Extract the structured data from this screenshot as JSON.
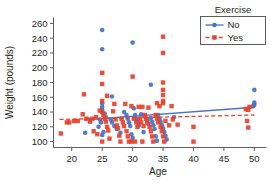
{
  "chart_data": {
    "type": "scatter",
    "title": "",
    "xlabel": "Age",
    "ylabel": "Weight (pounds)",
    "xlim": [
      17,
      52
    ],
    "ylim": [
      92,
      268
    ],
    "xticks": [
      20,
      25,
      30,
      35,
      40,
      45,
      50
    ],
    "yticks": [
      100,
      120,
      140,
      160,
      180,
      200,
      220,
      240,
      260
    ],
    "grid": false,
    "legend": {
      "title": "Exercise",
      "position": "top-right",
      "entries": [
        {
          "label": "No",
          "color": "#4472c4",
          "marker": "circle",
          "line": "solid"
        },
        {
          "label": "Yes",
          "color": "#e8402a",
          "marker": "square",
          "line": "dashed"
        }
      ]
    },
    "series": [
      {
        "name": "No",
        "color": "#4472c4",
        "marker": "circle",
        "fit_line": {
          "style": "solid",
          "x": [
            22,
            50
          ],
          "y": [
            129.5,
            146.5
          ]
        },
        "points": [
          [
            25,
            251
          ],
          [
            25,
            225
          ],
          [
            30,
            234
          ],
          [
            33,
            177
          ],
          [
            26.6,
            161
          ],
          [
            50,
            170
          ],
          [
            50,
            153
          ],
          [
            50,
            150
          ],
          [
            49.8,
            148
          ],
          [
            25,
            152
          ],
          [
            25,
            147
          ],
          [
            25,
            143
          ],
          [
            25.4,
            138
          ],
          [
            25.6,
            133
          ],
          [
            24.6,
            130
          ],
          [
            24.8,
            126
          ],
          [
            24.4,
            120
          ],
          [
            25.2,
            113
          ],
          [
            25,
            109
          ],
          [
            22.2,
            112
          ],
          [
            23,
            130
          ],
          [
            26.4,
            130
          ],
          [
            26.6,
            126
          ],
          [
            27,
            121
          ],
          [
            28.6,
            140
          ],
          [
            29,
            136
          ],
          [
            29.2,
            131
          ],
          [
            29.4,
            126
          ],
          [
            29.6,
            121
          ],
          [
            29.8,
            110
          ],
          [
            30.2,
            145
          ],
          [
            30.4,
            136
          ],
          [
            30.6,
            131
          ],
          [
            30.8,
            127
          ],
          [
            31,
            122
          ],
          [
            31.4,
            137
          ],
          [
            32,
            134
          ],
          [
            32.4,
            129
          ],
          [
            32.6,
            124
          ],
          [
            33,
            132
          ],
          [
            33.2,
            127
          ],
          [
            33.4,
            122
          ],
          [
            33.6,
            117
          ],
          [
            33.8,
            107
          ],
          [
            34.2,
            136
          ],
          [
            34.4,
            131
          ],
          [
            34.6,
            127
          ],
          [
            34.8,
            122
          ],
          [
            35,
            118
          ],
          [
            35.2,
            113
          ],
          [
            35.4,
            108
          ],
          [
            36.8,
            133
          ],
          [
            27.4,
            117
          ],
          [
            28,
            112
          ],
          [
            31.8,
            113
          ],
          [
            30,
            105
          ],
          [
            34,
            101
          ],
          [
            35.6,
            103
          ]
        ]
      },
      {
        "name": "Yes",
        "color": "#e8402a",
        "marker": "square",
        "fit_line": {
          "style": "dashed",
          "x": [
            18,
            50
          ],
          "y": [
            130,
            136
          ]
        },
        "points": [
          [
            35,
            242
          ],
          [
            35,
            220
          ],
          [
            30,
            188
          ],
          [
            25,
            193
          ],
          [
            25,
            178
          ],
          [
            35,
            180
          ],
          [
            35,
            170
          ],
          [
            35,
            163
          ],
          [
            35,
            155
          ],
          [
            35,
            152
          ],
          [
            36.4,
            148
          ],
          [
            22,
            164
          ],
          [
            25.8,
            162
          ],
          [
            25,
            155
          ],
          [
            27,
            151
          ],
          [
            28.8,
            151
          ],
          [
            29.8,
            148
          ],
          [
            31,
            147
          ],
          [
            31.6,
            147
          ],
          [
            32.6,
            146
          ],
          [
            34,
            152
          ],
          [
            34.4,
            148
          ],
          [
            18.2,
            111
          ],
          [
            19.2,
            126
          ],
          [
            19.6,
            126
          ],
          [
            20.4,
            128
          ],
          [
            21,
            128
          ],
          [
            21.8,
            137
          ],
          [
            22.4,
            131
          ],
          [
            23,
            127
          ],
          [
            23.4,
            131
          ],
          [
            24,
            133
          ],
          [
            24.6,
            142
          ],
          [
            25,
            140
          ],
          [
            25.2,
            136
          ],
          [
            25.4,
            131
          ],
          [
            25.6,
            127
          ],
          [
            25.8,
            120
          ],
          [
            26,
            115
          ],
          [
            25,
            100
          ],
          [
            26.8,
            141
          ],
          [
            27.2,
            130
          ],
          [
            27.4,
            122
          ],
          [
            27.6,
            118
          ],
          [
            27.8,
            108
          ],
          [
            28.2,
            131
          ],
          [
            28.4,
            126
          ],
          [
            28.6,
            121
          ],
          [
            29,
            114
          ],
          [
            29.2,
            107
          ],
          [
            29.4,
            100
          ],
          [
            29.8,
            100
          ],
          [
            30.2,
            131
          ],
          [
            30.6,
            126
          ],
          [
            30.8,
            120
          ],
          [
            31.2,
            131
          ],
          [
            31.4,
            126
          ],
          [
            31.8,
            121
          ],
          [
            32,
            136
          ],
          [
            32.2,
            131
          ],
          [
            32.4,
            126
          ],
          [
            32.8,
            120
          ],
          [
            33,
            114
          ],
          [
            33.2,
            107
          ],
          [
            33.4,
            100
          ],
          [
            33.8,
            136
          ],
          [
            34,
            131
          ],
          [
            34.2,
            126
          ],
          [
            34.6,
            120
          ],
          [
            34.8,
            114
          ],
          [
            35,
            107
          ],
          [
            35.2,
            100
          ],
          [
            35.4,
            128
          ],
          [
            36,
            122
          ],
          [
            36.6,
            130
          ],
          [
            37.4,
            123
          ],
          [
            40,
            120
          ],
          [
            40,
            100
          ],
          [
            48.6,
            144
          ],
          [
            49,
            143
          ],
          [
            49.2,
            147
          ],
          [
            48.8,
            128
          ],
          [
            49,
            119
          ],
          [
            23.6,
            114
          ],
          [
            24.2,
            110
          ],
          [
            26.2,
            104
          ],
          [
            28,
            100
          ],
          [
            30.4,
            100
          ],
          [
            31.6,
            100
          ]
        ]
      }
    ]
  }
}
